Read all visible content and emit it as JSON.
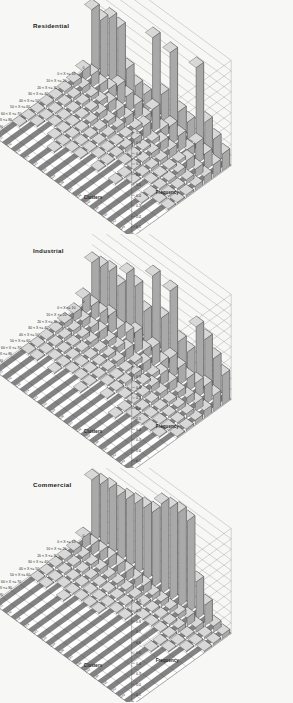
{
  "figure": {
    "background": "#f7f7f5",
    "panel_count": 3
  },
  "panels": [
    {
      "title": "Residential",
      "chart_index": 0
    },
    {
      "title": "Industrial",
      "chart_index": 1
    },
    {
      "title": "Commercial",
      "chart_index": 2
    }
  ],
  "axes": {
    "x_title": "Growth %",
    "y_title": "Clusters",
    "z_title": "Frequency",
    "growth_labels": [
      "0",
      "0 < X <= 10",
      "10 < X <= 20",
      "20 < X <= 30",
      "30 < X <= 40",
      "40 < X <= 50",
      "50 < X <= 60",
      "60 < X <= 70",
      "70 < X <= 80",
      "80 < X <= 90",
      "90 < X <= 100"
    ],
    "cluster_labels": [
      "c11",
      "c12",
      "c13",
      "c14",
      "c21",
      "c22",
      "c23",
      "c24",
      "c31",
      "c32",
      "c33",
      "c34",
      "c41",
      "c42",
      "c43",
      "c44"
    ],
    "z_ticks": [
      "1.0",
      "0.9",
      "0.8",
      "0.7",
      "0.6",
      "0.5",
      "0.4",
      "0.3",
      "0.2",
      "0.1",
      "0.0"
    ],
    "z_range": [
      0,
      1
    ]
  },
  "chart_data": [
    {
      "type": "bar",
      "title": "Residential",
      "xlabel": "Growth %",
      "ylabel": "Clusters",
      "zlabel": "Frequency",
      "zlim": [
        0,
        1
      ],
      "grid": true,
      "legend": "none",
      "categories_x": [
        "0",
        "0 < X <= 10",
        "10 < X <= 20",
        "20 < X <= 30",
        "30 < X <= 40",
        "40 < X <= 50",
        "50 < X <= 60",
        "60 < X <= 70",
        "70 < X <= 80",
        "80 < X <= 90",
        "90 < X <= 100"
      ],
      "categories_y": [
        "c11",
        "c12",
        "c13",
        "c14",
        "c21",
        "c22",
        "c23",
        "c24",
        "c31",
        "c32",
        "c33",
        "c34",
        "c41",
        "c42",
        "c43",
        "c44"
      ],
      "series": [
        {
          "name": "c11",
          "values": [
            0.62,
            0.1,
            0.05,
            0.03,
            0.02,
            0.02,
            0.01,
            0.01,
            0.01,
            0.0,
            0.0
          ]
        },
        {
          "name": "c12",
          "values": [
            0.58,
            0.12,
            0.06,
            0.03,
            0.02,
            0.01,
            0.01,
            0.01,
            0.0,
            0.0,
            0.0
          ]
        },
        {
          "name": "c13",
          "values": [
            0.66,
            0.09,
            0.04,
            0.03,
            0.02,
            0.01,
            0.01,
            0.0,
            0.0,
            0.0,
            0.0
          ]
        },
        {
          "name": "c14",
          "values": [
            0.63,
            0.11,
            0.05,
            0.03,
            0.02,
            0.01,
            0.01,
            0.01,
            0.0,
            0.0,
            0.0
          ]
        },
        {
          "name": "c21",
          "values": [
            0.3,
            0.2,
            0.1,
            0.06,
            0.04,
            0.02,
            0.02,
            0.01,
            0.01,
            0.0,
            0.0
          ]
        },
        {
          "name": "c22",
          "values": [
            0.2,
            0.16,
            0.09,
            0.05,
            0.03,
            0.02,
            0.01,
            0.01,
            0.0,
            0.0,
            0.0
          ]
        },
        {
          "name": "c23",
          "values": [
            0.18,
            0.14,
            0.08,
            0.05,
            0.03,
            0.02,
            0.01,
            0.01,
            0.0,
            0.0,
            0.0
          ]
        },
        {
          "name": "c24",
          "values": [
            0.78,
            0.08,
            0.04,
            0.02,
            0.01,
            0.01,
            0.01,
            0.0,
            0.0,
            0.0,
            0.0
          ]
        },
        {
          "name": "c31",
          "values": [
            0.3,
            0.22,
            0.12,
            0.06,
            0.04,
            0.02,
            0.01,
            0.01,
            0.0,
            0.0,
            0.0
          ]
        },
        {
          "name": "c32",
          "values": [
            0.76,
            0.09,
            0.04,
            0.02,
            0.01,
            0.01,
            0.0,
            0.0,
            0.0,
            0.0,
            0.0
          ]
        },
        {
          "name": "c33",
          "values": [
            0.26,
            0.18,
            0.09,
            0.05,
            0.03,
            0.02,
            0.01,
            0.01,
            0.0,
            0.0,
            0.0
          ]
        },
        {
          "name": "c34",
          "values": [
            0.22,
            0.15,
            0.08,
            0.04,
            0.03,
            0.02,
            0.01,
            0.0,
            0.0,
            0.0,
            0.0
          ]
        },
        {
          "name": "c41",
          "values": [
            0.8,
            0.08,
            0.03,
            0.02,
            0.01,
            0.01,
            0.0,
            0.0,
            0.0,
            0.0,
            0.0
          ]
        },
        {
          "name": "c42",
          "values": [
            0.34,
            0.2,
            0.1,
            0.05,
            0.03,
            0.02,
            0.01,
            0.01,
            0.0,
            0.0,
            0.0
          ]
        },
        {
          "name": "c43",
          "values": [
            0.24,
            0.16,
            0.08,
            0.04,
            0.02,
            0.01,
            0.01,
            0.0,
            0.0,
            0.0,
            0.0
          ]
        },
        {
          "name": "c44",
          "values": [
            0.16,
            0.12,
            0.07,
            0.04,
            0.02,
            0.01,
            0.01,
            0.0,
            0.0,
            0.0,
            0.0
          ]
        }
      ]
    },
    {
      "type": "bar",
      "title": "Industrial",
      "xlabel": "Growth %",
      "ylabel": "Clusters",
      "zlabel": "Frequency",
      "zlim": [
        0,
        1
      ],
      "grid": true,
      "legend": "none",
      "categories_x": [
        "0",
        "0 < X <= 10",
        "10 < X <= 20",
        "20 < X <= 30",
        "30 < X <= 40",
        "40 < X <= 50",
        "50 < X <= 60",
        "60 < X <= 70",
        "70 < X <= 80",
        "80 < X <= 90",
        "90 < X <= 100"
      ],
      "categories_y": [
        "c11",
        "c12",
        "c13",
        "c14",
        "c21",
        "c22",
        "c23",
        "c24",
        "c31",
        "c32",
        "c33",
        "c34",
        "c41",
        "c42",
        "c43",
        "c44"
      ],
      "series": [
        {
          "name": "c11",
          "values": [
            0.44,
            0.16,
            0.08,
            0.05,
            0.03,
            0.02,
            0.01,
            0.01,
            0.0,
            0.0,
            0.0
          ]
        },
        {
          "name": "c12",
          "values": [
            0.46,
            0.15,
            0.07,
            0.04,
            0.03,
            0.02,
            0.01,
            0.01,
            0.0,
            0.0,
            0.0
          ]
        },
        {
          "name": "c13",
          "values": [
            0.48,
            0.14,
            0.07,
            0.04,
            0.02,
            0.02,
            0.01,
            0.0,
            0.0,
            0.0,
            0.0
          ]
        },
        {
          "name": "c14",
          "values": [
            0.4,
            0.18,
            0.09,
            0.05,
            0.03,
            0.02,
            0.01,
            0.01,
            0.0,
            0.0,
            0.0
          ]
        },
        {
          "name": "c21",
          "values": [
            0.58,
            0.12,
            0.06,
            0.03,
            0.02,
            0.01,
            0.01,
            0.0,
            0.0,
            0.0,
            0.0
          ]
        },
        {
          "name": "c22",
          "values": [
            0.52,
            0.14,
            0.06,
            0.04,
            0.02,
            0.01,
            0.01,
            0.0,
            0.0,
            0.0,
            0.0
          ]
        },
        {
          "name": "c23",
          "values": [
            0.34,
            0.2,
            0.1,
            0.05,
            0.03,
            0.02,
            0.01,
            0.01,
            0.0,
            0.0,
            0.0
          ]
        },
        {
          "name": "c24",
          "values": [
            0.74,
            0.09,
            0.04,
            0.02,
            0.01,
            0.01,
            0.0,
            0.0,
            0.0,
            0.0,
            0.0
          ]
        },
        {
          "name": "c31",
          "values": [
            0.4,
            0.18,
            0.09,
            0.05,
            0.03,
            0.02,
            0.01,
            0.0,
            0.0,
            0.0,
            0.0
          ]
        },
        {
          "name": "c32",
          "values": [
            0.72,
            0.1,
            0.04,
            0.02,
            0.01,
            0.01,
            0.0,
            0.0,
            0.0,
            0.0,
            0.0
          ]
        },
        {
          "name": "c33",
          "values": [
            0.3,
            0.2,
            0.11,
            0.06,
            0.03,
            0.02,
            0.01,
            0.01,
            0.0,
            0.0,
            0.0
          ]
        },
        {
          "name": "c34",
          "values": [
            0.26,
            0.17,
            0.09,
            0.05,
            0.03,
            0.02,
            0.01,
            0.0,
            0.0,
            0.0,
            0.0
          ]
        },
        {
          "name": "c41",
          "values": [
            0.56,
            0.13,
            0.06,
            0.03,
            0.02,
            0.01,
            0.01,
            0.0,
            0.0,
            0.0,
            0.0
          ]
        },
        {
          "name": "c42",
          "values": [
            0.5,
            0.15,
            0.07,
            0.04,
            0.02,
            0.01,
            0.01,
            0.0,
            0.0,
            0.0,
            0.0
          ]
        },
        {
          "name": "c43",
          "values": [
            0.38,
            0.18,
            0.08,
            0.04,
            0.02,
            0.01,
            0.01,
            0.0,
            0.0,
            0.0,
            0.0
          ]
        },
        {
          "name": "c44",
          "values": [
            0.28,
            0.15,
            0.07,
            0.04,
            0.02,
            0.01,
            0.0,
            0.0,
            0.0,
            0.0,
            0.0
          ]
        }
      ]
    },
    {
      "type": "bar",
      "title": "Commercial",
      "xlabel": "Growth %",
      "ylabel": "Clusters",
      "zlabel": "Frequency",
      "zlim": [
        0,
        1
      ],
      "grid": true,
      "legend": "none",
      "categories_x": [
        "0",
        "0 < X <= 10",
        "10 < X <= 20",
        "20 < X <= 30",
        "30 < X <= 40",
        "40 < X <= 50",
        "50 < X <= 60",
        "60 < X <= 70",
        "70 < X <= 80",
        "80 < X <= 90",
        "90 < X <= 100"
      ],
      "categories_y": [
        "c11",
        "c12",
        "c13",
        "c14",
        "c21",
        "c22",
        "c23",
        "c24",
        "c31",
        "c32",
        "c33",
        "c34",
        "c41",
        "c42",
        "c43",
        "c44"
      ],
      "series": [
        {
          "name": "c11",
          "values": [
            0.6,
            0.11,
            0.05,
            0.03,
            0.02,
            0.01,
            0.01,
            0.0,
            0.0,
            0.0,
            0.0
          ]
        },
        {
          "name": "c12",
          "values": [
            0.62,
            0.1,
            0.05,
            0.03,
            0.02,
            0.01,
            0.01,
            0.0,
            0.0,
            0.0,
            0.0
          ]
        },
        {
          "name": "c13",
          "values": [
            0.64,
            0.1,
            0.04,
            0.03,
            0.02,
            0.01,
            0.0,
            0.0,
            0.0,
            0.0,
            0.0
          ]
        },
        {
          "name": "c14",
          "values": [
            0.63,
            0.1,
            0.05,
            0.03,
            0.02,
            0.01,
            0.01,
            0.0,
            0.0,
            0.0,
            0.0
          ]
        },
        {
          "name": "c21",
          "values": [
            0.66,
            0.09,
            0.04,
            0.02,
            0.01,
            0.01,
            0.0,
            0.0,
            0.0,
            0.0,
            0.0
          ]
        },
        {
          "name": "c22",
          "values": [
            0.68,
            0.09,
            0.04,
            0.02,
            0.01,
            0.01,
            0.0,
            0.0,
            0.0,
            0.0,
            0.0
          ]
        },
        {
          "name": "c23",
          "values": [
            0.7,
            0.08,
            0.04,
            0.02,
            0.01,
            0.01,
            0.0,
            0.0,
            0.0,
            0.0,
            0.0
          ]
        },
        {
          "name": "c24",
          "values": [
            0.72,
            0.08,
            0.03,
            0.02,
            0.01,
            0.0,
            0.0,
            0.0,
            0.0,
            0.0,
            0.0
          ]
        },
        {
          "name": "c31",
          "values": [
            0.86,
            0.05,
            0.02,
            0.01,
            0.01,
            0.0,
            0.0,
            0.0,
            0.0,
            0.0,
            0.0
          ]
        },
        {
          "name": "c32",
          "values": [
            0.88,
            0.05,
            0.02,
            0.01,
            0.0,
            0.0,
            0.0,
            0.0,
            0.0,
            0.0,
            0.0
          ]
        },
        {
          "name": "c33",
          "values": [
            0.9,
            0.04,
            0.02,
            0.01,
            0.0,
            0.0,
            0.0,
            0.0,
            0.0,
            0.0,
            0.0
          ]
        },
        {
          "name": "c34",
          "values": [
            0.88,
            0.05,
            0.02,
            0.01,
            0.0,
            0.0,
            0.0,
            0.0,
            0.0,
            0.0,
            0.0
          ]
        },
        {
          "name": "c41",
          "values": [
            0.36,
            0.08,
            0.04,
            0.02,
            0.01,
            0.01,
            0.0,
            0.0,
            0.0,
            0.0,
            0.0
          ]
        },
        {
          "name": "c42",
          "values": [
            0.2,
            0.05,
            0.02,
            0.01,
            0.01,
            0.0,
            0.0,
            0.0,
            0.0,
            0.0,
            0.0
          ]
        },
        {
          "name": "c43",
          "values": [
            0.06,
            0.02,
            0.01,
            0.01,
            0.0,
            0.0,
            0.0,
            0.0,
            0.0,
            0.0,
            0.0
          ]
        },
        {
          "name": "c44",
          "values": [
            0.04,
            0.02,
            0.01,
            0.0,
            0.0,
            0.0,
            0.0,
            0.0,
            0.0,
            0.0,
            0.0
          ]
        }
      ]
    }
  ]
}
